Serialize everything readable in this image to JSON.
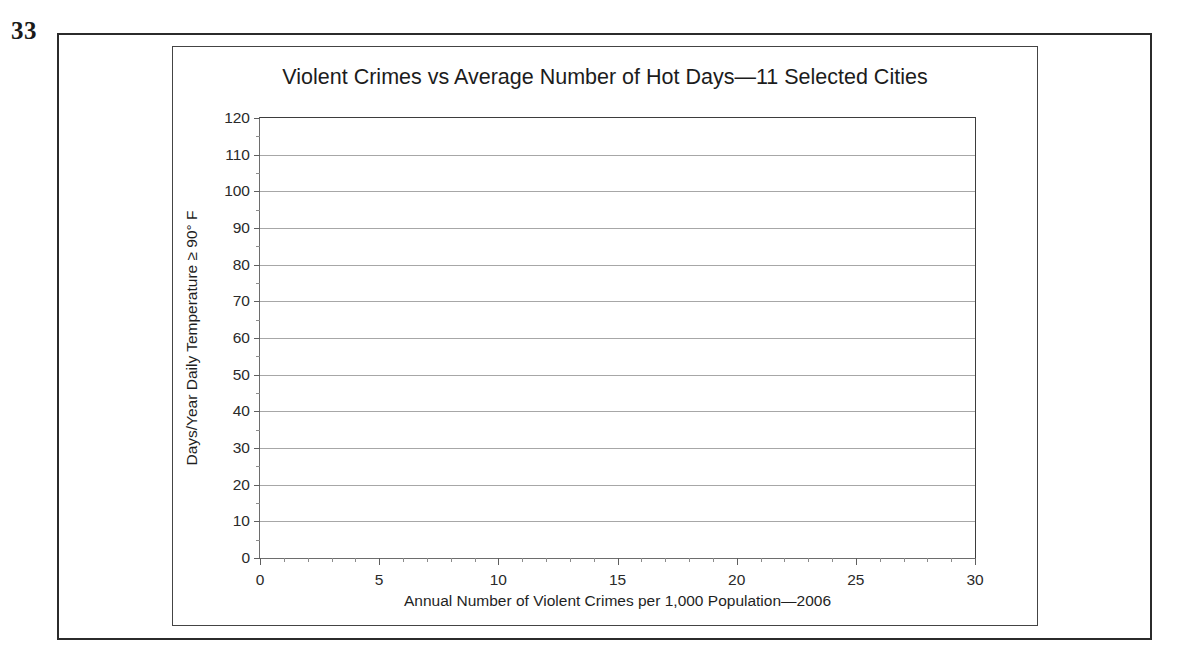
{
  "figure": {
    "number": "33"
  },
  "chart_data": {
    "type": "scatter",
    "title": "Violent Crimes vs Average Number of Hot Days—11 Selected Cities",
    "xlabel": "Annual Number of Violent Crimes per 1,000 Population—2006",
    "ylabel": "Days/Year Daily Temperature ≥ 90° F",
    "xlim": [
      0,
      30
    ],
    "ylim": [
      0,
      120
    ],
    "x_tick_step": 5,
    "y_tick_step": 10,
    "x_minor_tick_step": 1,
    "y_minor_tick_step": 5,
    "x_ticks": [
      "0",
      "5",
      "10",
      "15",
      "20",
      "25",
      "30"
    ],
    "y_ticks": [
      "0",
      "10",
      "20",
      "30",
      "40",
      "50",
      "60",
      "70",
      "80",
      "90",
      "100",
      "110",
      "120"
    ],
    "grid": "horizontal",
    "legend": "none",
    "series": [
      {
        "name": "11 Selected Cities",
        "x": [],
        "y": []
      }
    ],
    "annotations": [],
    "note": "Blank plotting grid — axes, ticks and horizontal gridlines only; no data markers are plotted."
  },
  "colors": {
    "outer_frame": "#2b2b2b",
    "inner_frame": "#444444",
    "plot_border": "#3d3d3d",
    "gridline": "#a7a7a7",
    "text": "#1c1c1c",
    "background": "#ffffff"
  }
}
